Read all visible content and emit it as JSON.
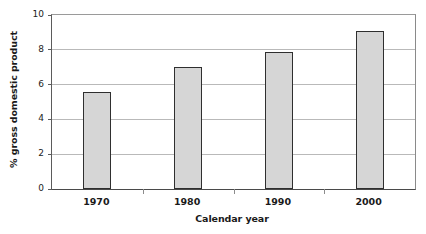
{
  "chart_data": {
    "type": "bar",
    "title": "",
    "xlabel": "Calendar year",
    "ylabel": "% gross domestic product",
    "categories": [
      "1970",
      "1980",
      "1990",
      "2000"
    ],
    "values": [
      5.6,
      7.0,
      7.9,
      9.1
    ],
    "ylim": [
      0,
      10
    ],
    "y_ticks": [
      0,
      2,
      4,
      6,
      8,
      10
    ],
    "y_tick_labels": [
      "0",
      "2",
      "4",
      "6",
      "8",
      "10"
    ],
    "grid": true,
    "legend": null,
    "bar_fill_color": "#d6d6d6",
    "bar_edge_color": "#2f2f2f",
    "gridline_color": "#b9b9b9",
    "axis_color": "#4a4a4a",
    "background_color": "#ffffff"
  }
}
